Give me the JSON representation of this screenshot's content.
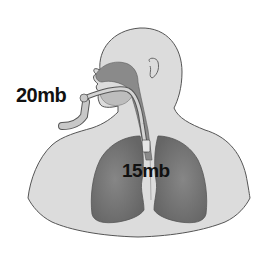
{
  "diagram": {
    "labels": {
      "upper_airway_pressure": "20mb",
      "lower_airway_pressure": "15mb"
    },
    "colors": {
      "background": "#ffffff",
      "body_fill": "#dcdcdc",
      "body_outline": "#555555",
      "airway_fill": "#8a8a8a",
      "lung_fill": "#7a7a7a",
      "lung_shade": "#6a6a6a",
      "tube_fill": "#c8c8c8",
      "label_text": "#111111"
    }
  }
}
